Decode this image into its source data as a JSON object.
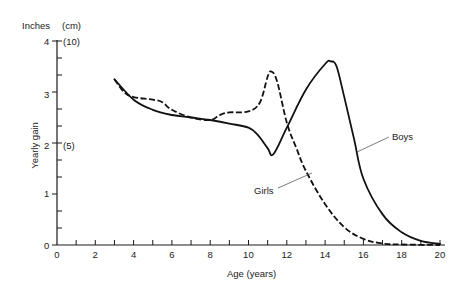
{
  "chart_data": {
    "type": "line",
    "title": "",
    "xlabel": "Age (years)",
    "ylabel": "Yearly gain",
    "y_unit_left": "Inches",
    "y_unit_right": "(cm)",
    "xlim": [
      0,
      20
    ],
    "ylim": [
      0,
      4
    ],
    "xticks": [
      0,
      2,
      4,
      6,
      8,
      10,
      12,
      14,
      16,
      18,
      20
    ],
    "xminor_step": 1,
    "yticks": [
      0,
      1,
      2,
      3,
      4
    ],
    "yminor_step": 0.333,
    "secondary_y_labels": [
      {
        "at": 4,
        "label": "(10)"
      },
      {
        "at": 2,
        "label": "(5)"
      }
    ],
    "grid": false,
    "legend": "inline labels with leader lines",
    "series": [
      {
        "name": "Boys",
        "style": "solid",
        "x": [
          3,
          4,
          5,
          6,
          7,
          8,
          9,
          10,
          10.5,
          11,
          11.3,
          12,
          13,
          14,
          14.3,
          14.6,
          15,
          15.5,
          16,
          17,
          18,
          19,
          20
        ],
        "y": [
          3.25,
          2.85,
          2.65,
          2.55,
          2.5,
          2.45,
          2.38,
          2.3,
          2.15,
          1.9,
          1.78,
          2.3,
          3.05,
          3.55,
          3.6,
          3.5,
          2.9,
          2.1,
          1.3,
          0.6,
          0.25,
          0.08,
          0.02
        ]
      },
      {
        "name": "Girls",
        "style": "dashed",
        "x": [
          3,
          3.5,
          4,
          5,
          5.5,
          6,
          7,
          8,
          8.5,
          9,
          10,
          10.6,
          11,
          11.2,
          11.5,
          12,
          12.5,
          13,
          14,
          15,
          16,
          17,
          18,
          20
        ],
        "y": [
          3.25,
          3.0,
          2.9,
          2.85,
          2.8,
          2.65,
          2.5,
          2.45,
          2.55,
          2.6,
          2.62,
          2.8,
          3.3,
          3.4,
          3.2,
          2.4,
          1.9,
          1.45,
          0.8,
          0.35,
          0.12,
          0.03,
          0.01,
          0
        ]
      }
    ],
    "annotations": [
      {
        "text": "Boys",
        "points_to_age": 15.7
      },
      {
        "text": "Girls",
        "points_to_age": 13.2
      }
    ]
  },
  "axis": {
    "y_unit_left": "Inches",
    "y_unit_right": "(cm)",
    "y_title": "Yearly gain",
    "x_title": "Age (years)",
    "y_tick_labels": [
      "0",
      "1",
      "2",
      "3",
      "4"
    ],
    "y_cm_10": "(10)",
    "y_cm_5": "(5)",
    "x_tick_labels": [
      "0",
      "2",
      "4",
      "6",
      "8",
      "10",
      "12",
      "14",
      "16",
      "18",
      "20"
    ]
  },
  "labels": {
    "boys": "Boys",
    "girls": "Girls"
  }
}
